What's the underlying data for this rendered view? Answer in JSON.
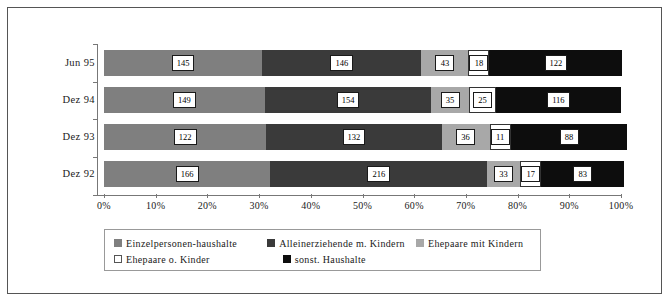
{
  "chart_data": {
    "type": "bar",
    "subtype": "stacked-100-horizontal",
    "title": "",
    "xlabel": "",
    "ylabel": "",
    "xlim": [
      0,
      100
    ],
    "grid": false,
    "legend_position": "bottom",
    "categories": [
      "Jun 95",
      "Dez 94",
      "Dez 93",
      "Dez 92"
    ],
    "x_tick_labels": [
      "0%",
      "10%",
      "20%",
      "30%",
      "40%",
      "50%",
      "60%",
      "70%",
      "80%",
      "90%",
      "100%"
    ],
    "x_tick_values": [
      0,
      10,
      20,
      30,
      40,
      50,
      60,
      70,
      80,
      90,
      100
    ],
    "series": [
      {
        "name": "Einzelpersonen-haushalte",
        "color": "#7f7f7f",
        "values": [
          145,
          149,
          122,
          166
        ]
      },
      {
        "name": "Alleinerziehende m. Kindern",
        "color": "#3a3a3a",
        "values": [
          146,
          154,
          132,
          216
        ]
      },
      {
        "name": "Ehepaare mit Kindern",
        "color": "#a8a8a8",
        "values": [
          43,
          35,
          36,
          33
        ]
      },
      {
        "name": "Ehepaare o. Kinder",
        "color": "#ffffff",
        "values": [
          18,
          25,
          11,
          17
        ]
      },
      {
        "name": "sonst. Haushalte",
        "color": "#0d0d0d",
        "values": [
          122,
          116,
          88,
          83
        ]
      }
    ],
    "row_totals": [
      474,
      479,
      389,
      515
    ],
    "rows": [
      {
        "category": "Jun 95",
        "segments": [
          {
            "series": "Einzelpersonen-haushalte",
            "value": 145,
            "percent": 30.6
          },
          {
            "series": "Alleinerziehende m. Kindern",
            "value": 146,
            "percent": 30.8
          },
          {
            "series": "Ehepaare mit Kindern",
            "value": 43,
            "percent": 9.1
          },
          {
            "series": "Ehepaare o. Kinder",
            "value": 18,
            "percent": 3.8
          },
          {
            "series": "sonst. Haushalte",
            "value": 122,
            "percent": 25.7
          }
        ]
      },
      {
        "category": "Dez 94",
        "segments": [
          {
            "series": "Einzelpersonen-haushalte",
            "value": 149,
            "percent": 31.1
          },
          {
            "series": "Alleinerziehende m. Kindern",
            "value": 154,
            "percent": 32.2
          },
          {
            "series": "Ehepaare mit Kindern",
            "value": 35,
            "percent": 7.3
          },
          {
            "series": "Ehepaare o. Kinder",
            "value": 25,
            "percent": 5.2
          },
          {
            "series": "sonst. Haushalte",
            "value": 116,
            "percent": 24.2
          }
        ]
      },
      {
        "category": "Dez 93",
        "segments": [
          {
            "series": "Einzelpersonen-haushalte",
            "value": 122,
            "percent": 31.4
          },
          {
            "series": "Alleinerziehende m. Kindern",
            "value": 132,
            "percent": 33.9
          },
          {
            "series": "Ehepaare mit Kindern",
            "value": 36,
            "percent": 9.3
          },
          {
            "series": "Ehepaare o. Kinder",
            "value": 11,
            "percent": 2.8
          },
          {
            "series": "sonst. Haushalte",
            "value": 88,
            "percent": 22.6
          }
        ]
      },
      {
        "category": "Dez 92",
        "segments": [
          {
            "series": "Einzelpersonen-haushalte",
            "value": 166,
            "percent": 32.2
          },
          {
            "series": "Alleinerziehende m. Kindern",
            "value": 216,
            "percent": 41.9
          },
          {
            "series": "Ehepaare mit Kindern",
            "value": 33,
            "percent": 6.4
          },
          {
            "series": "Ehepaare o. Kinder",
            "value": 17,
            "percent": 3.3
          },
          {
            "series": "sonst. Haushalte",
            "value": 83,
            "percent": 16.1
          }
        ]
      }
    ],
    "legend": [
      {
        "label": "Einzelpersonen-haushalte",
        "color": "#7f7f7f"
      },
      {
        "label": "Alleinerziehende m. Kindern",
        "color": "#3a3a3a"
      },
      {
        "label": "Ehepaare mit Kindern",
        "color": "#a8a8a8"
      },
      {
        "label": "Ehepaare o. Kinder",
        "color": "#ffffff"
      },
      {
        "label": "sonst. Haushalte",
        "color": "#0d0d0d"
      }
    ]
  },
  "frame": {
    "border_color": "#555555",
    "background": "#ffffff"
  }
}
